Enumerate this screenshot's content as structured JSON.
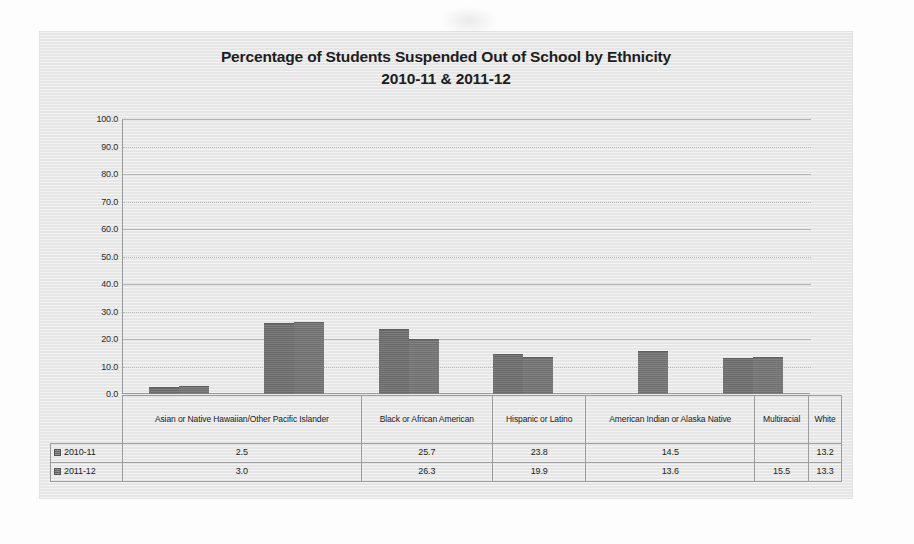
{
  "chart_data": {
    "type": "bar",
    "title": "Percentage of Students Suspended Out of School by Ethnicity",
    "subtitle": "2010-11 & 2011-12",
    "title_line1": "Percentage of Students Suspended Out of School by Ethnicity",
    "title_line2": "2010-11 & 2011-12",
    "xlabel": "",
    "ylabel": "",
    "ylim": [
      0.0,
      100.0
    ],
    "ytick_labels": [
      "100.0",
      "90.0",
      "80.0",
      "70.0",
      "60.0",
      "50.0",
      "40.0",
      "30.0",
      "20.0",
      "10.0",
      "0.0"
    ],
    "ytick_values": [
      100.0,
      90.0,
      80.0,
      70.0,
      60.0,
      50.0,
      40.0,
      30.0,
      20.0,
      10.0,
      0.0
    ],
    "grid": true,
    "legend_position": "data-table",
    "categories": [
      "Asian or Native Hawaiian/Other Pacific Islander",
      "Black or African American",
      "Hispanic or Latino",
      "American Indian or Alaska Native",
      "Multiracial",
      "White"
    ],
    "series": [
      {
        "name": "2010-11",
        "color": "#6e6e6e",
        "values": [
          2.5,
          25.7,
          23.8,
          14.5,
          null,
          13.2
        ],
        "display_values": [
          "2.5",
          "25.7",
          "23.8",
          "14.5",
          "",
          "13.2"
        ]
      },
      {
        "name": "2011-12",
        "color": "#747474",
        "values": [
          3.0,
          26.3,
          19.9,
          13.6,
          15.5,
          13.3
        ],
        "display_values": [
          "3.0",
          "26.3",
          "19.9",
          "13.6",
          "15.5",
          "13.3"
        ]
      }
    ]
  },
  "table": {
    "corner_label": "",
    "column_headers": [
      "Asian or Native Hawaiian/Other Pacific Islander",
      "Black or African American",
      "Hispanic or Latino",
      "American Indian or Alaska Native",
      "Multiracial",
      "White"
    ],
    "rows": [
      {
        "label": "2010-11",
        "cells": [
          "2.5",
          "25.7",
          "23.8",
          "14.5",
          "",
          "13.2"
        ]
      },
      {
        "label": "2011-12",
        "cells": [
          "3.0",
          "26.3",
          "19.9",
          "13.6",
          "15.5",
          "13.3"
        ]
      }
    ]
  },
  "colors": {
    "panel_background": "#e9e9e9",
    "page_background": "#fdfdfd",
    "bar_series_1": "#6e6e6e",
    "bar_series_2": "#747474",
    "gridline": "#b3b3b3",
    "axis": "#9a9a9a",
    "text": "#1d1d1d"
  }
}
